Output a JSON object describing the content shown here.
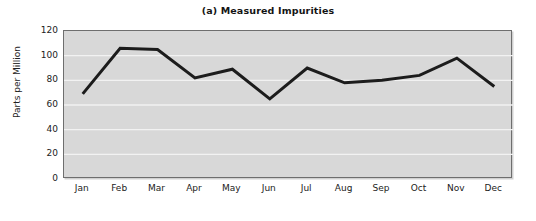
{
  "chart_data": {
    "type": "line",
    "title": "(a) Measured Impurities",
    "xlabel": "",
    "ylabel": "Parts per Million",
    "categories": [
      "Jan",
      "Feb",
      "Mar",
      "Apr",
      "May",
      "Jun",
      "Jul",
      "Aug",
      "Sep",
      "Oct",
      "Nov",
      "Dec"
    ],
    "values": [
      69,
      106,
      105,
      82,
      89,
      65,
      90,
      78,
      80,
      84,
      98,
      75
    ],
    "series": [
      {
        "name": "Measured Impurities",
        "values": [
          69,
          106,
          105,
          82,
          89,
          65,
          90,
          78,
          80,
          84,
          98,
          75
        ]
      }
    ],
    "ylim": [
      0,
      120
    ],
    "yticks": [
      0,
      20,
      40,
      60,
      80,
      100,
      120
    ],
    "ytick_labels": [
      "0",
      "20",
      "40",
      "60",
      "80",
      "100",
      "120"
    ],
    "grid": "horizontal",
    "legend": "none",
    "line_color": "#1c1c1c",
    "line_width": 3,
    "plot_background": "#d8d8d8",
    "gridline_color": "#f2f2f2",
    "figure_background": "#ffffff"
  }
}
